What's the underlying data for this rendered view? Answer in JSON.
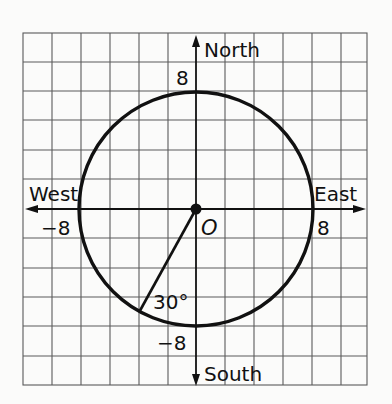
{
  "diagram": {
    "type": "coordinate-grid-circle",
    "grid": {
      "columns": 12,
      "rows": 12
    },
    "colors": {
      "ink": "#111111",
      "grid": "#555555",
      "background": "#fbfbfa"
    },
    "axes": {
      "north_label": "North",
      "south_label": "South",
      "east_label": "East",
      "west_label": "West"
    },
    "ticks": {
      "north": "8",
      "south": "−8",
      "east": "8",
      "west": "−8"
    },
    "center": {
      "label": "O"
    },
    "circle": {
      "radius_units": 8
    },
    "radius_segment": {
      "angle_label": "30°",
      "angle_from": "South",
      "direction": "toward West"
    }
  }
}
